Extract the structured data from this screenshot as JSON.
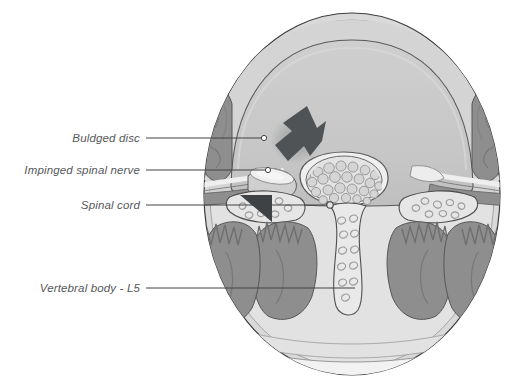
{
  "figure": {
    "kind": "anatomical-cross-section",
    "background_color": "#ffffff",
    "outline_color": "#3c3c3c",
    "palette": {
      "skin": "#d9d9d9",
      "fat": "#e4e4e4",
      "bone_body": "#c9c9c9",
      "bone_light": "#dedede",
      "muscle": "#8e8e8e",
      "muscle_dark": "#7c7c7c",
      "canal": "#e8e8e8",
      "nerve_light": "#efefef",
      "arrow": "#4f5356",
      "arrow_dark": "#3e4245",
      "label_text": "#55585a",
      "leader_line": "#3f4245"
    },
    "circle": {
      "center_x": 352,
      "center_y": 194,
      "radius_x": 148,
      "radius_y": 181
    }
  },
  "labels": [
    {
      "id": "buldged-disc",
      "text": "Buldged disc",
      "text_right_x": 140,
      "text_y": 138,
      "leader_from_x": 146,
      "leader_to_x": 261,
      "leader_y": 138,
      "marker_x": 264,
      "marker_y": 138,
      "marker_radius": 2.6
    },
    {
      "id": "impinged-spinal-nerve",
      "text": "Impinged spinal nerve",
      "text_right_x": 140,
      "text_y": 170,
      "leader_from_x": 146,
      "leader_to_x": 265,
      "leader_y": 170,
      "marker_x": 268,
      "marker_y": 170,
      "marker_radius": 2.6
    },
    {
      "id": "spinal-cord",
      "text": "Spinal cord",
      "text_right_x": 140,
      "text_y": 205,
      "leader_from_x": 146,
      "leader_to_x": 327,
      "leader_y": 205,
      "marker_x": 330,
      "marker_y": 205,
      "marker_radius": 3.2
    },
    {
      "id": "vertebral-body-l5",
      "text": "Vertebral body - L5",
      "text_right_x": 140,
      "text_y": 288,
      "leader_from_x": 146,
      "leader_to_x": 355,
      "leader_y": 288,
      "marker_x": 355,
      "marker_y": 288,
      "marker_radius": 0
    }
  ],
  "annotations": {
    "bulge_arrow": {
      "name": "bulge-direction-arrow",
      "description": "thick dark arrow pointing down-left into the posterior disc bulge",
      "color": "#4f5356"
    },
    "facet_arrow": {
      "name": "facet-triangle-arrow",
      "description": "dark triangular arrow in the left lateral recess pointing right",
      "color": "#3e4245"
    }
  },
  "structures": {
    "cauda_equina_rootlet_count": 25,
    "names": [
      "vertebral body",
      "bulged intervertebral disc",
      "spinal canal / thecal sac",
      "cauda equina nerve rootlets",
      "spinal nerve root",
      "psoas muscle",
      "paraspinal muscle",
      "spinous process",
      "lamina",
      "subcutaneous fat",
      "skin"
    ]
  }
}
